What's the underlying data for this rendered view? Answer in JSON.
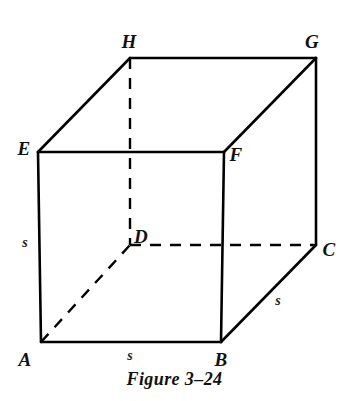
{
  "figure": {
    "caption": "Figure 3–24",
    "alt_name": "cube-diagram",
    "background_color": "#ffffff",
    "stroke_color": "#000000",
    "vertices": [
      {
        "id": "A",
        "label": "A",
        "x": 41,
        "y": 342,
        "label_x": 25,
        "label_y": 359,
        "hidden": false
      },
      {
        "id": "B",
        "label": "B",
        "x": 221,
        "y": 342,
        "label_x": 221,
        "label_y": 359,
        "hidden": false
      },
      {
        "id": "C",
        "label": "C",
        "x": 316,
        "y": 245,
        "label_x": 329,
        "label_y": 249,
        "hidden": false
      },
      {
        "id": "D",
        "label": "D",
        "x": 130,
        "y": 245,
        "label_x": 141,
        "label_y": 236,
        "hidden": true
      },
      {
        "id": "E",
        "label": "E",
        "x": 38,
        "y": 152,
        "label_x": 24,
        "label_y": 148,
        "hidden": false
      },
      {
        "id": "F",
        "label": "F",
        "x": 224,
        "y": 152,
        "label_x": 236,
        "label_y": 154,
        "hidden": false
      },
      {
        "id": "G",
        "label": "G",
        "x": 316,
        "y": 58,
        "label_x": 312,
        "label_y": 41,
        "hidden": false
      },
      {
        "id": "H",
        "label": "H",
        "x": 130,
        "y": 58,
        "label_x": 129,
        "label_y": 41,
        "hidden": false
      }
    ],
    "edges": [
      {
        "id": "AB",
        "from": "A",
        "to": "B",
        "style": "solid"
      },
      {
        "id": "BF",
        "from": "B",
        "to": "F",
        "style": "solid"
      },
      {
        "id": "FE",
        "from": "F",
        "to": "E",
        "style": "solid"
      },
      {
        "id": "EA",
        "from": "E",
        "to": "A",
        "style": "solid"
      },
      {
        "id": "EH",
        "from": "E",
        "to": "H",
        "style": "solid"
      },
      {
        "id": "FG",
        "from": "F",
        "to": "G",
        "style": "solid"
      },
      {
        "id": "HG",
        "from": "H",
        "to": "G",
        "style": "solid"
      },
      {
        "id": "GC",
        "from": "G",
        "to": "C",
        "style": "solid"
      },
      {
        "id": "BC",
        "from": "B",
        "to": "C",
        "style": "solid"
      },
      {
        "id": "HD",
        "from": "H",
        "to": "D",
        "style": "dashed"
      },
      {
        "id": "DC",
        "from": "D",
        "to": "C",
        "style": "dashed"
      },
      {
        "id": "AD",
        "from": "A",
        "to": "D",
        "style": "dashed"
      }
    ],
    "edge_labels": [
      {
        "id": "s-left",
        "text": "s",
        "edge": "EA",
        "x": 25,
        "y": 243
      },
      {
        "id": "s-bottom",
        "text": "s",
        "edge": "AB",
        "x": 130,
        "y": 356
      },
      {
        "id": "s-right",
        "text": "s",
        "edge": "BC",
        "x": 278,
        "y": 301
      }
    ]
  }
}
